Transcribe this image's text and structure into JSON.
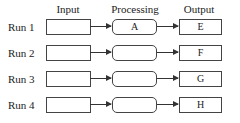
{
  "headers": {
    "input": "Input",
    "processing": "Processing",
    "output": "Output"
  },
  "rows": [
    {
      "label": "Run 1",
      "input": "",
      "processing": "A",
      "output": "E"
    },
    {
      "label": "Run 2",
      "input": "",
      "processing": "",
      "output": "F"
    },
    {
      "label": "Run 3",
      "input": "",
      "processing": "",
      "output": "G"
    },
    {
      "label": "Run 4",
      "input": "",
      "processing": "",
      "output": "H"
    }
  ]
}
